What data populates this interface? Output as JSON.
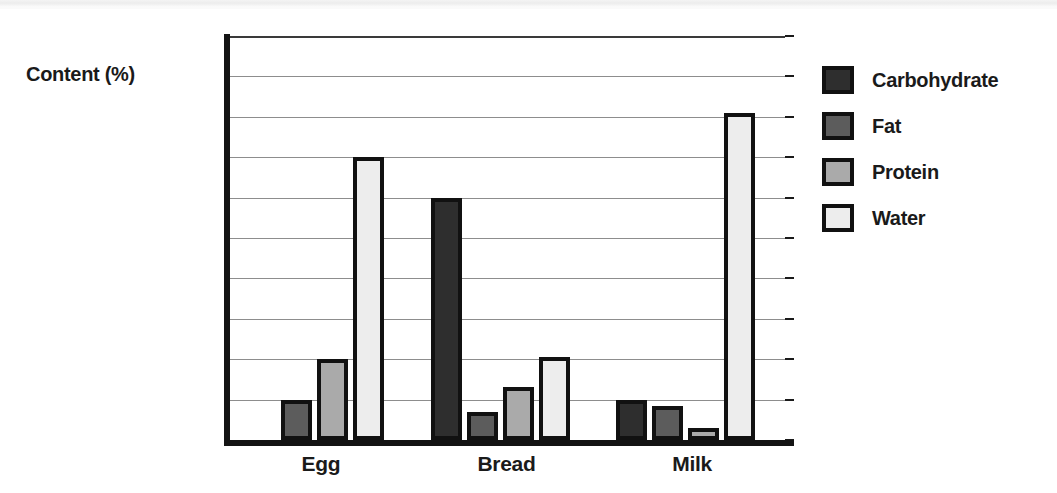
{
  "chart_data": {
    "type": "bar",
    "title": "",
    "subtitle": "",
    "xlabel": "",
    "ylabel": "Content (%)",
    "ylim": [
      0,
      100
    ],
    "ytick_step": 10,
    "yticks": [
      100,
      90,
      80,
      70,
      60,
      50,
      40,
      30,
      20,
      10,
      0
    ],
    "categories": [
      "Egg",
      "Bread",
      "Milk"
    ],
    "grid": "horizontal",
    "legend_position": "right",
    "series": [
      {
        "name": "Carbohydrate",
        "color": "#2e2e2e",
        "values": [
          0,
          60,
          10
        ]
      },
      {
        "name": "Fat",
        "color": "#5c5c5c",
        "values": [
          10,
          7,
          8.5
        ]
      },
      {
        "name": "Protein",
        "color": "#aaaaaa",
        "values": [
          20,
          13,
          3
        ]
      },
      {
        "name": "Water",
        "color": "#ededed",
        "values": [
          70,
          20.5,
          81
        ]
      }
    ],
    "bar_edge_color": "#111111",
    "axis_color": "#141414",
    "gridline_color": "#8d8d8d",
    "background": "#ffffff"
  }
}
